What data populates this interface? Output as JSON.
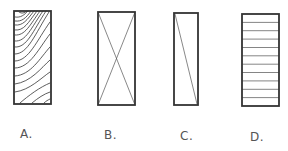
{
  "figure": {
    "stroke_color": "#333333",
    "label_color": "#555555",
    "panels": [
      {
        "id": "A",
        "label": "A.",
        "symbol": "wood-grain",
        "rect": {
          "x": 14,
          "y": 11,
          "w": 37,
          "h": 93
        },
        "label_pos": {
          "x": 20,
          "y": 128
        }
      },
      {
        "id": "B",
        "label": "B.",
        "symbol": "x-cross",
        "rect": {
          "x": 98,
          "y": 12,
          "w": 37,
          "h": 93
        },
        "label_pos": {
          "x": 104,
          "y": 129
        }
      },
      {
        "id": "C",
        "label": "C.",
        "symbol": "single-diagonal",
        "rect": {
          "x": 174,
          "y": 13,
          "w": 24,
          "h": 92
        },
        "label_pos": {
          "x": 180,
          "y": 130
        }
      },
      {
        "id": "D",
        "label": "D.",
        "symbol": "horizontal-hatch",
        "hatch_lines": 10,
        "rect": {
          "x": 242,
          "y": 14,
          "w": 37,
          "h": 92
        },
        "label_pos": {
          "x": 250,
          "y": 131
        }
      }
    ]
  }
}
